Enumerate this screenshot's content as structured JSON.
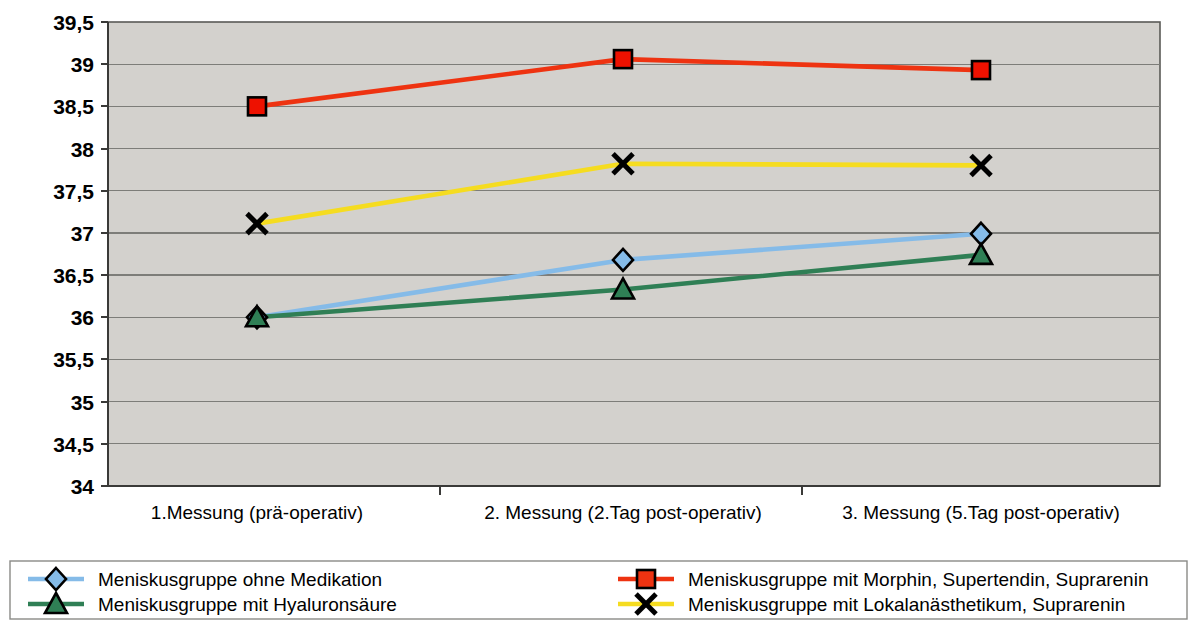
{
  "chart_data": {
    "type": "line",
    "title": "",
    "xlabel": "",
    "ylabel": "",
    "ylim": [
      34,
      39.5
    ],
    "ytick_step": 0.5,
    "grid": true,
    "legend_position": "bottom",
    "plot_background": "#d3d1cd",
    "categories": [
      "1.Messung (prä-operativ)",
      "2. Messung (2.Tag post-operativ)",
      "3. Messung (5.Tag post-operativ)"
    ],
    "ytick_labels": [
      "39,5",
      "39",
      "38,5",
      "38",
      "37,5",
      "37",
      "36,5",
      "36",
      "35,5",
      "35",
      "34,5",
      "34"
    ],
    "ytick_values": [
      39.5,
      39,
      38.5,
      38,
      37.5,
      37,
      36.5,
      36,
      35.5,
      35,
      34.5,
      34
    ],
    "series": [
      {
        "name": "Meniskusgruppe ohne Medikation",
        "values": [
          36.0,
          36.68,
          36.99
        ],
        "color": "#85bbe8",
        "marker": "diamond",
        "marker_fill": "#85bbe8"
      },
      {
        "name": "Meniskusgruppe mit Hyaluronsäure",
        "values": [
          36.0,
          36.33,
          36.74
        ],
        "color": "#2f7f55",
        "marker": "triangle",
        "marker_fill": "#2f7f55"
      },
      {
        "name": "Meniskusgruppe mit Morphin, Supertendin, Suprarenin",
        "values": [
          38.5,
          39.06,
          38.93
        ],
        "color": "#ee3311",
        "marker": "square",
        "marker_fill": "#ee1100"
      },
      {
        "name": "Meniskusgruppe mit Lokalanästhetikum, Suprarenin",
        "values": [
          37.11,
          37.82,
          37.8
        ],
        "color": "#f5dc20",
        "marker": "cross",
        "marker_fill": "#000000"
      }
    ]
  },
  "legend": {
    "entries": [
      {
        "label": "Meniskusgruppe ohne Medikation",
        "color": "#85bbe8",
        "marker": "diamond",
        "column": 0
      },
      {
        "label": "Meniskusgruppe mit Hyaluronsäure",
        "color": "#2f7f55",
        "marker": "triangle",
        "column": 0
      },
      {
        "label": "Meniskusgruppe mit Morphin, Supertendin, Suprarenin",
        "color": "#ee3311",
        "marker": "square",
        "column": 1
      },
      {
        "label": "Meniskusgruppe mit Lokalanästhetikum, Suprarenin",
        "color": "#f5dc20",
        "marker": "cross",
        "column": 1
      }
    ]
  }
}
